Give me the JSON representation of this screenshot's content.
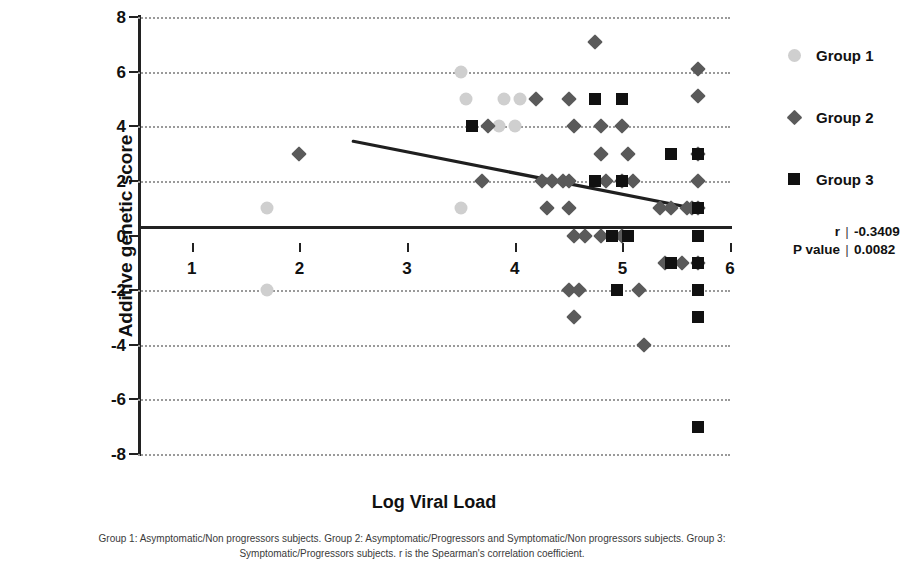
{
  "chart_data": {
    "type": "scatter",
    "title": "",
    "xlabel": "Log Viral Load",
    "ylabel": "Additive genetic score",
    "xlim": [
      0.5,
      6.0
    ],
    "ylim": [
      -8,
      8
    ],
    "xticks": [
      1,
      2,
      3,
      4,
      5,
      6
    ],
    "yticks": [
      -8,
      -6,
      -4,
      -2,
      0,
      2,
      4,
      6,
      8
    ],
    "grid": "horizontal-dotted",
    "legend_position": "right",
    "series": [
      {
        "name": "Group 1",
        "marker": "circle",
        "color": "#cfcfcf",
        "points": [
          [
            1.7,
            1
          ],
          [
            1.7,
            -2
          ],
          [
            3.5,
            1
          ],
          [
            3.5,
            6
          ],
          [
            3.55,
            5
          ],
          [
            3.9,
            5
          ],
          [
            4.05,
            5
          ],
          [
            3.85,
            4
          ],
          [
            4.0,
            4
          ]
        ]
      },
      {
        "name": "Group 2",
        "marker": "diamond",
        "color": "#5a5a5a",
        "points": [
          [
            2.0,
            3
          ],
          [
            3.7,
            2
          ],
          [
            3.75,
            4
          ],
          [
            4.2,
            5
          ],
          [
            4.5,
            5
          ],
          [
            4.55,
            4
          ],
          [
            4.25,
            2
          ],
          [
            4.35,
            2
          ],
          [
            4.45,
            2
          ],
          [
            4.5,
            2
          ],
          [
            4.3,
            1
          ],
          [
            4.5,
            1
          ],
          [
            4.5,
            -2
          ],
          [
            4.6,
            -2
          ],
          [
            4.55,
            -3
          ],
          [
            4.55,
            0
          ],
          [
            4.65,
            0
          ],
          [
            4.75,
            7.1
          ],
          [
            4.8,
            4
          ],
          [
            4.8,
            3
          ],
          [
            4.85,
            2
          ],
          [
            4.8,
            0
          ],
          [
            5.0,
            4
          ],
          [
            5.05,
            3
          ],
          [
            5.0,
            2
          ],
          [
            5.0,
            0
          ],
          [
            5.1,
            2
          ],
          [
            5.15,
            -2
          ],
          [
            5.2,
            -4
          ],
          [
            5.35,
            1
          ],
          [
            5.4,
            -1
          ],
          [
            5.45,
            1
          ],
          [
            5.7,
            6.1
          ],
          [
            5.7,
            5.1
          ],
          [
            5.7,
            3
          ],
          [
            5.7,
            2
          ],
          [
            5.7,
            1
          ],
          [
            5.65,
            1
          ],
          [
            5.6,
            1
          ],
          [
            5.7,
            -1
          ],
          [
            5.55,
            -1
          ]
        ]
      },
      {
        "name": "Group 3",
        "marker": "square",
        "color": "#111111",
        "points": [
          [
            3.6,
            4
          ],
          [
            4.75,
            5
          ],
          [
            5.0,
            5
          ],
          [
            4.75,
            2
          ],
          [
            5.0,
            2
          ],
          [
            4.9,
            0
          ],
          [
            5.05,
            0
          ],
          [
            4.95,
            -2
          ],
          [
            5.45,
            3
          ],
          [
            5.45,
            -1
          ],
          [
            5.7,
            3
          ],
          [
            5.7,
            1
          ],
          [
            5.7,
            0
          ],
          [
            5.7,
            -1
          ],
          [
            5.7,
            -2
          ],
          [
            5.7,
            -3
          ],
          [
            5.7,
            -7
          ]
        ]
      }
    ],
    "trend_line": {
      "x0": 2.5,
      "y0": 3.45,
      "x1": 5.72,
      "y1": 0.95,
      "color": "#1f1f1f"
    }
  },
  "stats": {
    "r_label": "r",
    "r_value": "-0.3409",
    "p_label": "P value",
    "p_value": "0.0082",
    "separator": "|"
  },
  "caption": "Group 1: Asymptomatic/Non progressors subjects. Group 2: Asymptomatic/Progressors and Symptomatic/Non progressors subjects. Group 3: Symptomatic/Progressors subjects. r is the Spearman's correlation coefficient."
}
